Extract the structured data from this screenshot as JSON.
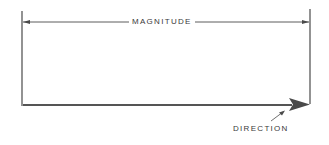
{
  "diagram": {
    "labels": {
      "magnitude": "MAGNITUDE",
      "direction": "DIRECTION"
    },
    "colors": {
      "line": "#4a4a4a",
      "text": "#3a3a3a",
      "background": "#ffffff"
    }
  }
}
